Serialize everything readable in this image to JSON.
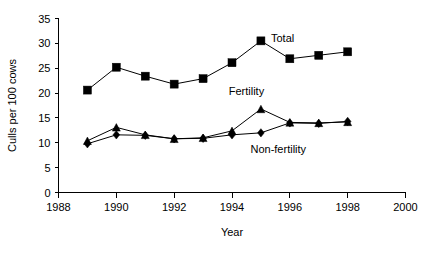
{
  "chart_data": {
    "type": "line",
    "title": "",
    "xlabel": "Year",
    "ylabel": "Culls per 100 cows",
    "x": [
      1989,
      1990,
      1991,
      1992,
      1993,
      1994,
      1995,
      1996,
      1997,
      1998
    ],
    "xlim": [
      1988,
      2000
    ],
    "ylim": [
      0,
      35
    ],
    "xticks": [
      1988,
      1990,
      1992,
      1994,
      1996,
      1998,
      2000
    ],
    "xtick_labels": [
      "1988",
      "1990",
      "1992",
      "1994",
      "1996",
      "1998",
      "2000"
    ],
    "yticks": [
      0,
      5,
      10,
      15,
      20,
      25,
      30,
      35
    ],
    "ytick_labels": [
      "0",
      "5",
      "10",
      "15",
      "20",
      "25",
      "30",
      "35"
    ],
    "grid": false,
    "legend_position": "inline-annotations",
    "series": [
      {
        "name": "Total",
        "marker": "square",
        "color": "#000000",
        "values": [
          20.6,
          25.2,
          23.4,
          21.8,
          22.9,
          26.1,
          30.5,
          26.9,
          27.6,
          28.3
        ]
      },
      {
        "name": "Fertility",
        "marker": "triangle",
        "color": "#000000",
        "values": [
          10.4,
          13.1,
          11.6,
          10.8,
          11.0,
          12.4,
          16.8,
          14.1,
          14.0,
          14.2
        ]
      },
      {
        "name": "Non-fertility",
        "marker": "diamond",
        "color": "#000000",
        "values": [
          9.8,
          11.6,
          11.5,
          10.8,
          10.9,
          11.6,
          12.0,
          14.0,
          13.9,
          14.3
        ]
      }
    ],
    "annotations": [
      {
        "text": "Total",
        "x": 1995.75,
        "y": 30.3
      },
      {
        "text": "Fertility",
        "x": 1994.5,
        "y": 19.6
      },
      {
        "text": "Non-fertility",
        "x": 1995.6,
        "y": 7.9
      }
    ]
  }
}
